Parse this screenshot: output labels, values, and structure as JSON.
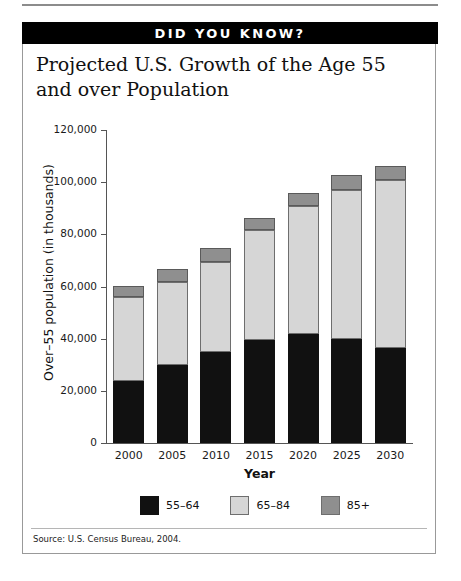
{
  "banner": {
    "text": "DID YOU KNOW?"
  },
  "title": "Projected U.S. Growth of the Age 55 and over Population",
  "source": "Source: U.S. Census Bureau, 2004.",
  "colors": {
    "band_5564": "#111111",
    "band_6584": "#d6d6d6",
    "band_85plus": "#8f8f8f",
    "banner_bg": "#000000",
    "banner_text": "#ffffff",
    "axis": "#555555"
  },
  "chart_data": {
    "type": "bar",
    "stacked": true,
    "title": "Projected U.S. Growth of the Age 55 and over Population",
    "xlabel": "Year",
    "ylabel": "Over–55 population (in thousands)",
    "categories": [
      "2000",
      "2005",
      "2010",
      "2015",
      "2020",
      "2025",
      "2030"
    ],
    "ylim": [
      0,
      120000
    ],
    "yticks": [
      0,
      20000,
      40000,
      60000,
      80000,
      100000,
      120000
    ],
    "ytick_labels": [
      "0",
      "20,000",
      "40,000",
      "60,000",
      "80,000",
      "100,000",
      "120,000"
    ],
    "grid": false,
    "legend_position": "bottom",
    "series": [
      {
        "name": "55–64",
        "color": "#111111",
        "values": [
          23700,
          29900,
          34900,
          39500,
          41800,
          39900,
          36400
        ]
      },
      {
        "name": "65–84",
        "color": "#d6d6d6",
        "values": [
          32200,
          31800,
          34500,
          42100,
          49000,
          57100,
          64400
        ]
      },
      {
        "name": "85+",
        "color": "#8f8f8f",
        "values": [
          4200,
          5000,
          5400,
          4600,
          5000,
          5700,
          5400
        ]
      }
    ],
    "totals": [
      60100,
      66700,
      74800,
      86200,
      95800,
      102700,
      106200
    ]
  }
}
